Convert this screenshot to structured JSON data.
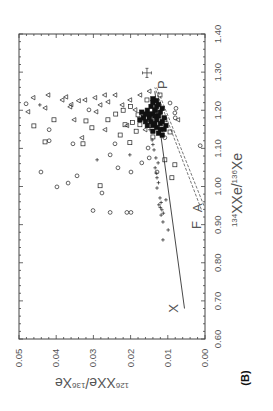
{
  "figure": {
    "panel_label": "(B)",
    "x_axis_label_main": "Xe/",
    "x_axis_label_sup1": "134",
    "x_axis_label_sup2": "136",
    "x_axis_label_end": "Xe",
    "y_axis_label_main": "Xe/",
    "y_axis_label_sup1": "126",
    "y_axis_label_sup2": "136",
    "y_axis_label_end": "Xe",
    "orientation_note": "Figure is rotated 90° counter-clockwise"
  },
  "chart_data": {
    "type": "scatter",
    "title": "",
    "panel": "(B)",
    "xlabel": "134Xe/136Xe",
    "ylabel": "126Xe/136Xe",
    "xlim": [
      0.6,
      1.4
    ],
    "ylim": [
      0.0,
      0.05
    ],
    "x_ticks": [
      "0.60",
      "0.70",
      "0.80",
      "0.90",
      "1.00",
      "1.10",
      "1.20",
      "1.30",
      "1.40"
    ],
    "y_ticks": [
      "0.00",
      "0.01",
      "0.02",
      "0.03",
      "0.04",
      "0.05"
    ],
    "grid": false,
    "legend": null,
    "rotation_deg": -90,
    "series": [
      {
        "name": "circles",
        "marker": "circle",
        "points": [
          [
            1.217,
            0.0481
          ],
          [
            1.038,
            0.0441
          ],
          [
            0.999,
            0.0398
          ],
          [
            1.009,
            0.0368
          ],
          [
            1.028,
            0.0344
          ],
          [
            0.937,
            0.0301
          ],
          [
            0.983,
            0.0277
          ],
          [
            0.932,
            0.0255
          ],
          [
            0.932,
            0.021
          ],
          [
            1.049,
            0.0234
          ],
          [
            1.038,
            0.0199
          ],
          [
            1.038,
            0.0129
          ],
          [
            1.083,
            0.0255
          ],
          [
            1.112,
            0.0355
          ],
          [
            1.149,
            0.0419
          ],
          [
            1.12,
            0.0419
          ],
          [
            1.112,
            0.0242
          ],
          [
            1.101,
            0.0153
          ],
          [
            1.128,
            0.0108
          ],
          [
            1.193,
            0.0081
          ],
          [
            1.219,
            0.0094
          ],
          [
            1.107,
            0.0013
          ],
          [
            1.201,
            0.0312
          ],
          [
            0.932,
            0.0199
          ],
          [
            1.062,
            0.017
          ],
          [
            1.075,
            0.015
          ],
          [
            1.18,
            0.008
          ],
          [
            1.205,
            0.0078
          ]
        ]
      },
      {
        "name": "squares",
        "marker": "square",
        "points": [
          [
            1.159,
            0.046
          ],
          [
            1.117,
            0.043
          ],
          [
            1.175,
            0.0406
          ],
          [
            1.112,
            0.0328
          ],
          [
            1.002,
            0.0282
          ],
          [
            1.172,
            0.032
          ],
          [
            1.154,
            0.0304
          ],
          [
            1.135,
            0.0228
          ],
          [
            1.162,
            0.0215
          ],
          [
            1.162,
            0.0175
          ],
          [
            1.188,
            0.018
          ],
          [
            1.175,
            0.0148
          ],
          [
            1.227,
            0.0156
          ],
          [
            1.201,
            0.0134
          ],
          [
            1.24,
            0.0121
          ],
          [
            1.175,
            0.0108
          ],
          [
            1.143,
            0.0094
          ],
          [
            1.07,
            0.0108
          ],
          [
            1.023,
            0.0089
          ],
          [
            1.057,
            0.0081
          ],
          [
            1.115,
            0.0202
          ],
          [
            1.175,
            0.0261
          ],
          [
            1.19,
            0.024
          ],
          [
            1.2,
            0.022
          ],
          [
            1.168,
            0.0195
          ],
          [
            1.145,
            0.0185
          ],
          [
            1.21,
            0.02
          ],
          [
            1.18,
            0.0165
          ],
          [
            1.16,
            0.015
          ],
          [
            1.13,
            0.014
          ]
        ]
      },
      {
        "name": "triangles",
        "marker": "triangle",
        "points": [
          [
            1.196,
            0.0476
          ],
          [
            1.233,
            0.0462
          ],
          [
            1.24,
            0.0422
          ],
          [
            1.227,
            0.0384
          ],
          [
            1.209,
            0.0363
          ],
          [
            1.235,
            0.0374
          ],
          [
            1.175,
            0.0352
          ],
          [
            1.227,
            0.0323
          ],
          [
            1.233,
            0.0296
          ],
          [
            1.214,
            0.0282
          ],
          [
            1.196,
            0.0293
          ],
          [
            1.222,
            0.0261
          ],
          [
            1.24,
            0.0242
          ],
          [
            1.214,
            0.0223
          ],
          [
            1.227,
            0.0202
          ],
          [
            1.201,
            0.0188
          ],
          [
            1.128,
            0.0331
          ],
          [
            1.149,
            0.0269
          ],
          [
            1.149,
            0.0161
          ],
          [
            1.175,
            0.0073
          ],
          [
            1.206,
            0.043
          ],
          [
            1.24,
            0.0175
          ],
          [
            1.215,
            0.036
          ],
          [
            1.225,
            0.034
          ],
          [
            1.24,
            0.027
          ],
          [
            1.25,
            0.015
          ],
          [
            1.16,
            0.021
          ]
        ]
      },
      {
        "name": "plus",
        "marker": "plus",
        "points": [
          [
            0.886,
            0.0099
          ],
          [
            0.907,
            0.0113
          ],
          [
            0.925,
            0.0118
          ],
          [
            0.939,
            0.0116
          ],
          [
            0.952,
            0.0124
          ],
          [
            0.97,
            0.0121
          ],
          [
            0.996,
            0.0129
          ],
          [
            1.023,
            0.0129
          ],
          [
            1.049,
            0.0134
          ],
          [
            1.075,
            0.0132
          ],
          [
            1.096,
            0.0137
          ],
          [
            1.122,
            0.0142
          ],
          [
            1.149,
            0.0148
          ],
          [
            1.175,
            0.0153
          ],
          [
            1.196,
            0.0129
          ],
          [
            1.083,
            0.0202
          ],
          [
            1.07,
            0.029
          ],
          [
            1.062,
            0.0126
          ],
          [
            0.86,
            0.0113
          ],
          [
            0.965,
            0.0105
          ],
          [
            1.214,
            0.0444
          ],
          [
            1.227,
            0.0134
          ],
          [
            0.93,
            0.0112
          ],
          [
            0.945,
            0.012
          ],
          [
            0.958,
            0.0118
          ],
          [
            1.01,
            0.0125
          ],
          [
            1.035,
            0.0131
          ],
          [
            1.11,
            0.014
          ]
        ]
      },
      {
        "name": "dense-cluster",
        "marker": "filled-square",
        "points": [
          [
            1.16,
            0.014
          ],
          [
            1.17,
            0.0145
          ],
          [
            1.18,
            0.015
          ],
          [
            1.19,
            0.014
          ],
          [
            1.2,
            0.0135
          ],
          [
            1.21,
            0.013
          ],
          [
            1.175,
            0.013
          ],
          [
            1.185,
            0.0125
          ],
          [
            1.195,
            0.012
          ],
          [
            1.165,
            0.012
          ],
          [
            1.155,
            0.013
          ],
          [
            1.15,
            0.012
          ],
          [
            1.17,
            0.0115
          ],
          [
            1.18,
            0.011
          ],
          [
            1.19,
            0.015
          ],
          [
            1.2,
            0.0155
          ],
          [
            1.21,
            0.0145
          ],
          [
            1.22,
            0.014
          ],
          [
            1.215,
            0.0125
          ],
          [
            1.205,
            0.0115
          ],
          [
            1.16,
            0.0155
          ],
          [
            1.17,
            0.016
          ],
          [
            1.18,
            0.0165
          ],
          [
            1.19,
            0.016
          ],
          [
            1.145,
            0.014
          ],
          [
            1.14,
            0.0125
          ],
          [
            1.135,
            0.0115
          ],
          [
            1.15,
            0.011
          ],
          [
            1.16,
            0.0105
          ],
          [
            1.225,
            0.013
          ],
          [
            1.23,
            0.014
          ],
          [
            1.195,
            0.017
          ],
          [
            1.175,
            0.0175
          ],
          [
            1.185,
            0.0135
          ],
          [
            1.165,
            0.0135
          ]
        ]
      }
    ],
    "lines": [
      {
        "name": "mixing-line-X",
        "style": "solid",
        "points": [
          [
            0.68,
            0.0055
          ],
          [
            1.25,
            0.0135
          ]
        ]
      },
      {
        "name": "mixing-line-FA-1",
        "style": "dashed",
        "points": [
          [
            0.94,
            0.001
          ],
          [
            1.26,
            0.0135
          ]
        ]
      },
      {
        "name": "mixing-line-FA-2",
        "style": "dashed",
        "points": [
          [
            0.95,
            0.0003
          ],
          [
            1.26,
            0.013
          ]
        ]
      }
    ],
    "annotations": [
      {
        "text": "X",
        "x": 0.68,
        "y": 0.0085
      },
      {
        "text": "F",
        "x": 0.899,
        "y": 0.0024
      },
      {
        "text": "A",
        "x": 0.944,
        "y": 0.0022
      },
      {
        "text": "P",
        "x": 1.267,
        "y": 0.0116
      }
    ],
    "error_bar": {
      "x": 1.298,
      "y": 0.0156,
      "x_err": 0.012,
      "y_err": 0.0012
    }
  }
}
